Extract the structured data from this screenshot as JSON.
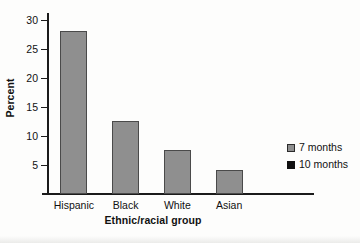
{
  "chart_data": {
    "type": "bar",
    "title": "",
    "xlabel": "Ethnic/racial group",
    "ylabel": "Percent",
    "categories": [
      "Hispanic",
      "Black",
      "White",
      "Asian"
    ],
    "series": [
      {
        "name": "7 months",
        "color": "#8f8f8f",
        "values": [
          28.0,
          12.6,
          7.5,
          4.2
        ]
      },
      {
        "name": "10 months",
        "color": "#101010",
        "values": [
          0,
          0,
          0,
          0
        ]
      }
    ],
    "ylim": [
      0,
      31
    ],
    "yticks": [
      5,
      10,
      15,
      20,
      25,
      30
    ],
    "ytick_labels": [
      "5",
      "10",
      "15",
      "20",
      "25",
      "30"
    ],
    "grid": false,
    "legend_position": "right"
  },
  "legend": {
    "entries": [
      {
        "label": "7 months",
        "swatch": "gray"
      },
      {
        "label": "10 months",
        "swatch": "black"
      }
    ]
  },
  "axes": {
    "y_title": "Percent",
    "x_title": "Ethnic/racial group"
  }
}
